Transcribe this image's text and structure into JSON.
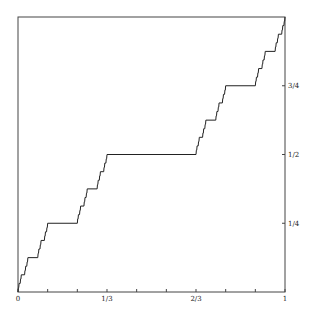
{
  "chart_data": {
    "type": "line",
    "title": "",
    "subtitle": "",
    "xlabel": "",
    "ylabel": "",
    "xlim": [
      0,
      1
    ],
    "ylim": [
      0,
      1
    ],
    "grid": false,
    "legend": null,
    "x_ticks": [
      {
        "value": 0,
        "label": "0"
      },
      {
        "value": 0.1111,
        "label": ""
      },
      {
        "value": 0.2222,
        "label": ""
      },
      {
        "value": 0.3333,
        "label": "1/3"
      },
      {
        "value": 0.4444,
        "label": ""
      },
      {
        "value": 0.5556,
        "label": ""
      },
      {
        "value": 0.6667,
        "label": "2/3"
      },
      {
        "value": 0.7778,
        "label": ""
      },
      {
        "value": 0.8889,
        "label": ""
      },
      {
        "value": 1,
        "label": "1"
      }
    ],
    "y_ticks": [
      {
        "value": 0.25,
        "label": "1/4"
      },
      {
        "value": 0.5,
        "label": "1/2"
      },
      {
        "value": 0.75,
        "label": "3/4"
      }
    ],
    "y_axis_position": "right",
    "series": [
      {
        "name": "Cantor function",
        "description": "Devil's staircase: plateau y=1/2 on [1/3,2/3], y=1/4 on [1/9,2/9], y=3/4 on [7/9,8/9], recursively",
        "recursion_depth": 6
      }
    ]
  },
  "colors": {
    "line": "#222222",
    "axis": "#444444",
    "background": "#ffffff"
  }
}
